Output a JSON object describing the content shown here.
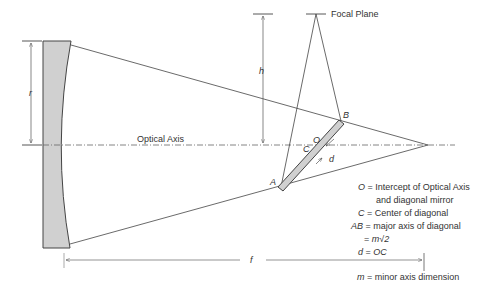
{
  "diagram": {
    "labels": {
      "focal_plane": "Focal Plane",
      "optical_axis": "Optical Axis",
      "h": "h",
      "r": "r",
      "f": "f",
      "A": "A",
      "B": "B",
      "O": "O",
      "C": "C",
      "d": "d"
    },
    "legend": [
      {
        "sym": "O",
        "eq": " = ",
        "text": "Intercept of Optical Axis"
      },
      {
        "sym": "",
        "eq": "",
        "text": "and diagonal mirror"
      },
      {
        "sym": "C",
        "eq": " = ",
        "text": "Center of diagonal"
      },
      {
        "sym": "AB",
        "eq": " = ",
        "text": "major axis of diagonal"
      },
      {
        "sym": "",
        "eq": "= ",
        "text": "m√2"
      },
      {
        "sym": "d",
        "eq": " = ",
        "text": "OC"
      }
    ],
    "footnote": {
      "sym": "m",
      "eq": " = ",
      "text": "minor axis dimension"
    },
    "colors": {
      "line": "#444444",
      "mirror_fill": "#d0d0d0",
      "text": "#333333"
    }
  }
}
